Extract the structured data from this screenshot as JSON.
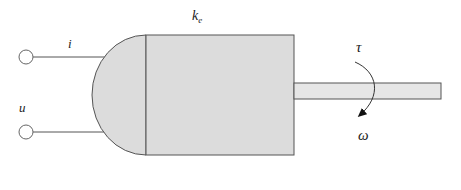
{
  "diagram": {
    "title": "",
    "type": "dc-motor-schematic",
    "labels": {
      "current": "i",
      "voltage": "u",
      "constant_base": "k",
      "constant_sub": "e",
      "torque": "τ",
      "angular_velocity": "ω"
    },
    "components": [
      {
        "name": "input-terminal-top",
        "kind": "terminal"
      },
      {
        "name": "input-terminal-bottom",
        "kind": "terminal"
      },
      {
        "name": "motor-end-cap",
        "kind": "semicircle"
      },
      {
        "name": "motor-body",
        "kind": "rectangle"
      },
      {
        "name": "output-shaft",
        "kind": "rectangle"
      },
      {
        "name": "rotation-arrow",
        "kind": "curved-arrow"
      }
    ],
    "colors": {
      "fill": "#dcdcdc",
      "stroke": "#555555",
      "text": "#222222",
      "background": "#ffffff"
    }
  }
}
